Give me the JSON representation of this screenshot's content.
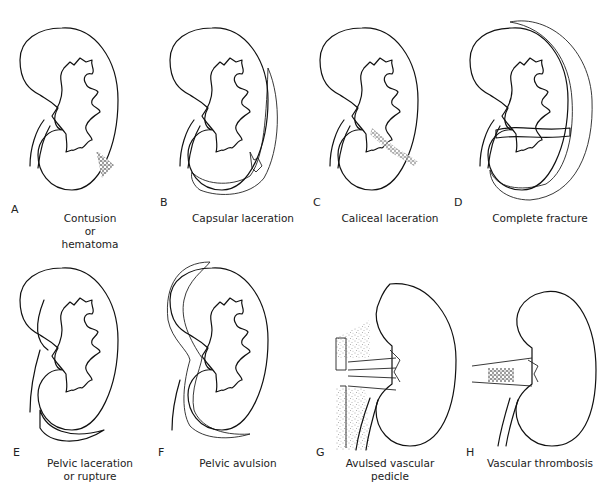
{
  "figure": {
    "panels": [
      {
        "letter": "A",
        "caption_lines": [
          "Contusion",
          "or",
          "hematoma"
        ]
      },
      {
        "letter": "B",
        "caption_lines": [
          "Capsular laceration"
        ]
      },
      {
        "letter": "C",
        "caption_lines": [
          "Caliceal laceration"
        ]
      },
      {
        "letter": "D",
        "caption_lines": [
          "Complete fracture"
        ]
      },
      {
        "letter": "E",
        "caption_lines": [
          "Pelvic laceration",
          "or rupture"
        ]
      },
      {
        "letter": "F",
        "caption_lines": [
          "Pelvic avulsion"
        ]
      },
      {
        "letter": "G",
        "caption_lines": [
          "Avulsed vascular",
          "pedicle"
        ]
      },
      {
        "letter": "H",
        "caption_lines": [
          "Vascular thrombosis"
        ]
      }
    ],
    "colors": {
      "ink": "#111111",
      "background": "#ffffff",
      "stipple": "#555555"
    }
  }
}
